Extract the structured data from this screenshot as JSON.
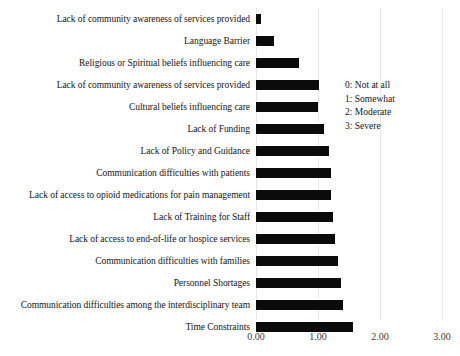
{
  "chart_data": {
    "type": "bar",
    "orientation": "horizontal",
    "title": "",
    "subtitle": "",
    "xlabel": "",
    "ylabel": "",
    "xlim": [
      0,
      3
    ],
    "xticks": [
      0,
      1,
      2,
      3
    ],
    "xtick_labels": [
      "0.00",
      "1.00",
      "2.00",
      "3.00"
    ],
    "grid": true,
    "grid_axis": "x",
    "bar_color": "#0b0b0b",
    "legend_position": "right-inside",
    "categories": [
      "Lack of community awareness of services provided",
      "Language Barrier",
      "Religious or Spiritual beliefs influencing care",
      "Lack of community awareness of services provided",
      "Cultural beliefs influencing care",
      "Lack of Funding",
      "Lack of Policy and Guidance",
      "Communication difficulties with patients",
      "Lack of access to opioid medications for pain management",
      "Lack of Training for Staff",
      "Lack of access to end-of-life or hospice services",
      "Communication difficulties with families",
      "Personnel Shortages",
      "Communication difficulties among the interdisciplinary team",
      "Time Constraints"
    ],
    "values": [
      0.08,
      0.29,
      0.69,
      1.02,
      1.0,
      1.1,
      1.18,
      1.21,
      1.21,
      1.24,
      1.27,
      1.32,
      1.37,
      1.4,
      1.56
    ],
    "legend_entries": [
      "0: Not at all",
      "1: Somewhat",
      "2: Moderate",
      "3: Severe"
    ]
  }
}
